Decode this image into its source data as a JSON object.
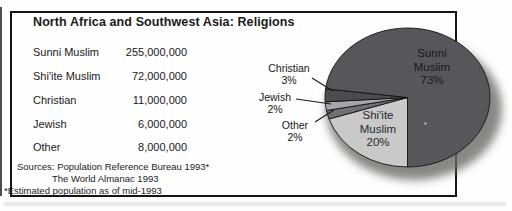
{
  "panel": {
    "title": "North Africa and Southwest Asia: Religions",
    "table": {
      "rows": [
        {
          "label": "Sunni Muslim",
          "value": "255,000,000"
        },
        {
          "label": "Shi'ite Muslim",
          "value": "72,000,000"
        },
        {
          "label": "Christian",
          "value": "11,000,000"
        },
        {
          "label": "Jewish",
          "value": "6,000,000"
        },
        {
          "label": "Other",
          "value": "8,000,000"
        }
      ]
    },
    "sources": {
      "line1": "Sources: Population Reference Bureau 1993*",
      "line2": "The World Almanac 1993",
      "footnote": "*Estimated population as of mid-1993"
    }
  },
  "chart_data": {
    "type": "pie",
    "title": "North Africa and Southwest Asia: Religions",
    "legend_position": "none",
    "segments": [
      {
        "label": "Sunni Muslim",
        "value": 255000000,
        "pct": 73,
        "color": "#57575b",
        "label_placement": "inside"
      },
      {
        "label": "Shi'ite Muslim",
        "value": 72000000,
        "pct": 20,
        "color": "#c9c9c9",
        "label_placement": "inside"
      },
      {
        "label": "Christian",
        "value": 11000000,
        "pct": 3,
        "color": "#4c4c50",
        "label_placement": "callout"
      },
      {
        "label": "Jewish",
        "value": 6000000,
        "pct": 2,
        "color": "#a6a6a8",
        "label_placement": "callout"
      },
      {
        "label": "Other",
        "value": 8000000,
        "pct": 2,
        "color": "#717174",
        "label_placement": "callout"
      }
    ],
    "draw_order": [
      "Shi'ite Muslim",
      "Other",
      "Jewish",
      "Christian",
      "Sunni Muslim"
    ],
    "start_angle_deg": 90,
    "clockwise": true
  },
  "pie_labels": {
    "sunni": {
      "line1": "Sunni",
      "line2": "Muslim",
      "line3": "73%"
    },
    "shiite": {
      "line1": "Shi'ite",
      "line2": "Muslim",
      "line3": "20%"
    },
    "christian": {
      "line1": "Christian",
      "line2": "3%"
    },
    "jewish": {
      "line1": "Jewish",
      "line2": "2%"
    },
    "other": {
      "line1": "Other",
      "line2": "2%"
    }
  }
}
